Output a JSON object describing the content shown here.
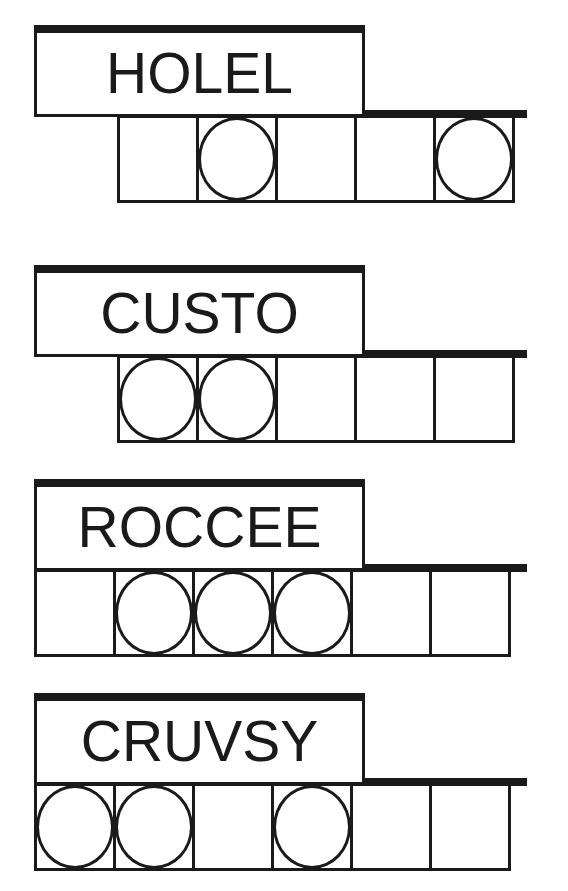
{
  "puzzles": [
    {
      "jumbled_word": "HOLEL",
      "tile_count": 5,
      "tiles_start_x": 117,
      "circled_positions": [
        2,
        5
      ],
      "tiles": [
        {
          "index": 1,
          "circled": false,
          "letter": ""
        },
        {
          "index": 2,
          "circled": true,
          "letter": ""
        },
        {
          "index": 3,
          "circled": false,
          "letter": ""
        },
        {
          "index": 4,
          "circled": false,
          "letter": ""
        },
        {
          "index": 5,
          "circled": true,
          "letter": ""
        }
      ]
    },
    {
      "jumbled_word": "CUSTO",
      "tile_count": 5,
      "tiles_start_x": 117,
      "circled_positions": [
        1,
        2
      ],
      "tiles": [
        {
          "index": 1,
          "circled": true,
          "letter": ""
        },
        {
          "index": 2,
          "circled": true,
          "letter": ""
        },
        {
          "index": 3,
          "circled": false,
          "letter": ""
        },
        {
          "index": 4,
          "circled": false,
          "letter": ""
        },
        {
          "index": 5,
          "circled": false,
          "letter": ""
        }
      ]
    },
    {
      "jumbled_word": "ROCCEE",
      "tile_count": 6,
      "tiles_start_x": 34,
      "circled_positions": [
        2,
        3,
        4
      ],
      "tiles": [
        {
          "index": 1,
          "circled": false,
          "letter": ""
        },
        {
          "index": 2,
          "circled": true,
          "letter": ""
        },
        {
          "index": 3,
          "circled": true,
          "letter": ""
        },
        {
          "index": 4,
          "circled": true,
          "letter": ""
        },
        {
          "index": 5,
          "circled": false,
          "letter": ""
        },
        {
          "index": 6,
          "circled": false,
          "letter": ""
        }
      ]
    },
    {
      "jumbled_word": "CRUVSY",
      "tile_count": 6,
      "tiles_start_x": 34,
      "circled_positions": [
        1,
        2,
        4
      ],
      "tiles": [
        {
          "index": 1,
          "circled": true,
          "letter": ""
        },
        {
          "index": 2,
          "circled": true,
          "letter": ""
        },
        {
          "index": 3,
          "circled": false,
          "letter": ""
        },
        {
          "index": 4,
          "circled": true,
          "letter": ""
        },
        {
          "index": 5,
          "circled": false,
          "letter": ""
        },
        {
          "index": 6,
          "circled": false,
          "letter": ""
        }
      ]
    }
  ],
  "colors": {
    "ink": "#1a1a1a",
    "paper": "#ffffff"
  }
}
